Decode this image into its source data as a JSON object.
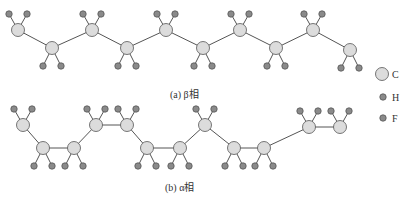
{
  "captions": {
    "beta": "(a) β相",
    "alpha": "(b) α相"
  },
  "legend": [
    {
      "label": "C",
      "kind": "carbon"
    },
    {
      "label": "H",
      "kind": "hydrogen"
    },
    {
      "label": "F",
      "kind": "fluorine"
    }
  ],
  "colors": {
    "carbon_fill": "#dcdcdc",
    "small_fill": "#8a8a8a",
    "stroke": "#555555",
    "bond": "#555555"
  },
  "beta_chain": {
    "carbons": [
      [
        18,
        30
      ],
      [
        52,
        48
      ],
      [
        92,
        30
      ],
      [
        127,
        48
      ],
      [
        166,
        30
      ],
      [
        203,
        48
      ],
      [
        240,
        30
      ],
      [
        276,
        48
      ],
      [
        313,
        30
      ],
      [
        350,
        50
      ]
    ]
  },
  "alpha_chain": {
    "carbons": [
      [
        23,
        125
      ],
      [
        43,
        148
      ],
      [
        74,
        148
      ],
      [
        96,
        125
      ],
      [
        127,
        125
      ],
      [
        147,
        148
      ],
      [
        180,
        148
      ],
      [
        205,
        125
      ],
      [
        234,
        148
      ],
      [
        264,
        148
      ],
      [
        309,
        127
      ],
      [
        340,
        127
      ]
    ],
    "up": [
      true,
      false,
      false,
      true,
      true,
      false,
      false,
      true,
      false,
      false,
      true,
      true
    ]
  }
}
